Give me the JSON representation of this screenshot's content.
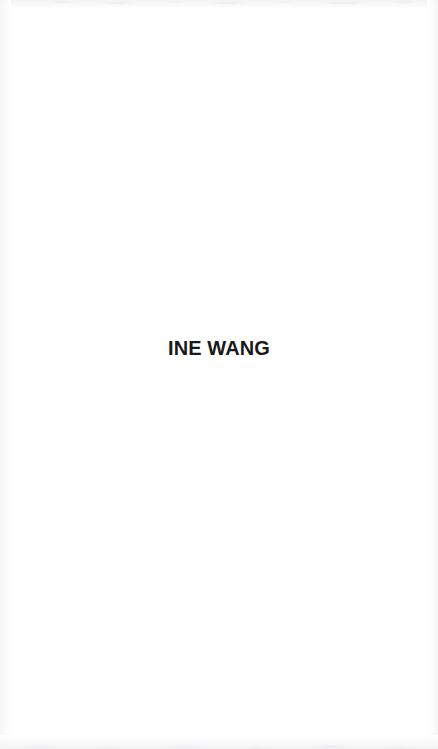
{
  "page": {
    "kind": "scanned-document-fragment",
    "background_color": "#ffffff",
    "width_px": 438,
    "height_px": 749
  },
  "content": {
    "heading": {
      "text": "INE WANG",
      "color": "#1a1a1a",
      "weight": "bold",
      "approx_font_size_px": 20,
      "alignment": "center",
      "approx_top_px": 341,
      "approx_left_px": 186,
      "approx_right_px": 277
    }
  },
  "artifacts": {
    "top_edge_label": "scan-edge-shadow-top",
    "bottom_edge_label": "scan-edge-shadow-bottom",
    "left_edge_label": "scan-edge-shadow-left",
    "right_edge_label": "scan-edge-shadow-right",
    "noise_color": "#f2f2f4"
  }
}
